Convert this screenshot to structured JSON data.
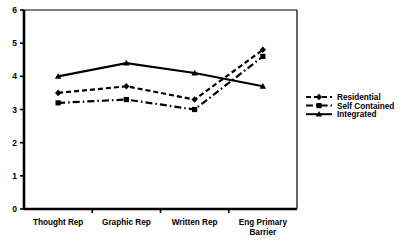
{
  "chart_data": {
    "type": "line",
    "title": "",
    "xlabel": "",
    "ylabel": "",
    "categories": [
      "Thought Rep",
      "Graphic Rep",
      "Written Rep",
      "Eng Primary Barrier"
    ],
    "category_lines": [
      [
        "Thought Rep"
      ],
      [
        "Graphic Rep"
      ],
      [
        "Written Rep"
      ],
      [
        "Eng Primary",
        "Barrier"
      ]
    ],
    "series": [
      {
        "name": "Residential",
        "values": [
          3.5,
          3.7,
          3.3,
          4.8
        ],
        "marker": "diamond",
        "line_style": "dashed",
        "color": "#000000"
      },
      {
        "name": "Self Contained",
        "values": [
          3.2,
          3.3,
          3.0,
          4.6
        ],
        "marker": "square",
        "line_style": "dash-dot",
        "color": "#000000"
      },
      {
        "name": "Integrated",
        "values": [
          4.0,
          4.4,
          4.1,
          3.7
        ],
        "marker": "triangle",
        "line_style": "solid",
        "color": "#000000"
      }
    ],
    "ylim": [
      0,
      6
    ],
    "yticks": [
      0,
      1,
      2,
      3,
      4,
      5,
      6
    ],
    "ytick_labels": [
      "0",
      "1",
      "2",
      "3",
      "4",
      "5",
      "6"
    ],
    "grid": false,
    "legend_position": "right",
    "frame_color": "#000000",
    "background_color": "#ffffff"
  }
}
